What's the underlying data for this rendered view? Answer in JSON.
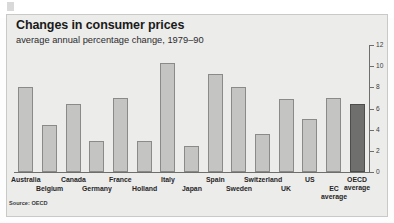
{
  "chart_data": {
    "type": "bar",
    "title": "Changes in consumer prices",
    "subtitle": "average annual percentage change, 1979–90",
    "source": "Source: OECD",
    "xlabel": "",
    "ylabel": "",
    "ylim": [
      0,
      12
    ],
    "yticks": [
      0,
      2,
      4,
      6,
      8,
      10,
      12
    ],
    "ytick_labels": [
      "0",
      "2",
      "4",
      "6",
      "8",
      "10",
      "12"
    ],
    "grid": false,
    "legend": "none",
    "categories": [
      "Australia",
      "Belgium",
      "Canada",
      "Germany",
      "France",
      "Holland",
      "Italy",
      "Japan",
      "Spain",
      "Sweden",
      "Switzerland",
      "UK",
      "US",
      "EC average",
      "OECD average"
    ],
    "values": [
      8.0,
      4.4,
      6.4,
      2.9,
      7.0,
      2.9,
      10.3,
      2.5,
      9.3,
      8.0,
      3.6,
      6.9,
      5.0,
      7.0,
      6.4
    ],
    "highlight_index": 14,
    "colors": {
      "bar": "#c4c4c2",
      "bar_border": "#8a8a88",
      "bar_highlight": "#6f6f6e",
      "bar_highlight_border": "#4d4d4c",
      "panel_background": "#ececeb",
      "axis": "#6e6e6e",
      "text": "#262626"
    }
  }
}
